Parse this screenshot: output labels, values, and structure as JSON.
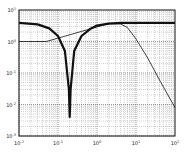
{
  "chart_data": {
    "type": "line",
    "title": "",
    "xlabel": "",
    "ylabel": "",
    "xscale": "log",
    "yscale": "log",
    "xlim": [
      0.01,
      100
    ],
    "ylim": [
      0.001,
      10
    ],
    "grid": true,
    "legend": null,
    "x_ticks": [
      "10^-2",
      "10^-1",
      "10^0",
      "10^1",
      "10^2"
    ],
    "y_ticks": [
      "10^1",
      "10^0",
      "10^-1",
      "10^-2",
      "10^-3"
    ],
    "series": [
      {
        "name": "notch response (thick)",
        "style": "thick",
        "x": [
          0.01,
          0.03,
          0.06,
          0.1,
          0.15,
          0.19,
          0.2,
          0.21,
          0.26,
          0.4,
          0.7,
          1.0,
          2.0,
          4.0,
          10,
          30,
          100
        ],
        "y": [
          3.9,
          3.5,
          2.6,
          1.5,
          0.5,
          0.03,
          0.004,
          0.03,
          0.5,
          1.5,
          2.6,
          3.2,
          3.7,
          3.9,
          3.9,
          3.9,
          3.9
        ]
      },
      {
        "name": "low-pass rolloff (thin)",
        "style": "thin",
        "x": [
          0.01,
          0.05,
          2.0,
          4.0,
          6.0,
          10,
          20,
          40,
          100
        ],
        "y": [
          1.0,
          1.0,
          3.7,
          3.6,
          2.8,
          1.2,
          0.3,
          0.06,
          0.008
        ]
      }
    ]
  },
  "labels": {
    "x": [
      "10",
      "10",
      "10",
      "10",
      "10"
    ],
    "x_exp": [
      "-2",
      "-1",
      "0",
      "1",
      "2"
    ],
    "y": [
      "10",
      "10",
      "10",
      "10",
      "10"
    ],
    "y_exp": [
      "1",
      "0",
      "-1",
      "-2",
      "-3"
    ]
  }
}
